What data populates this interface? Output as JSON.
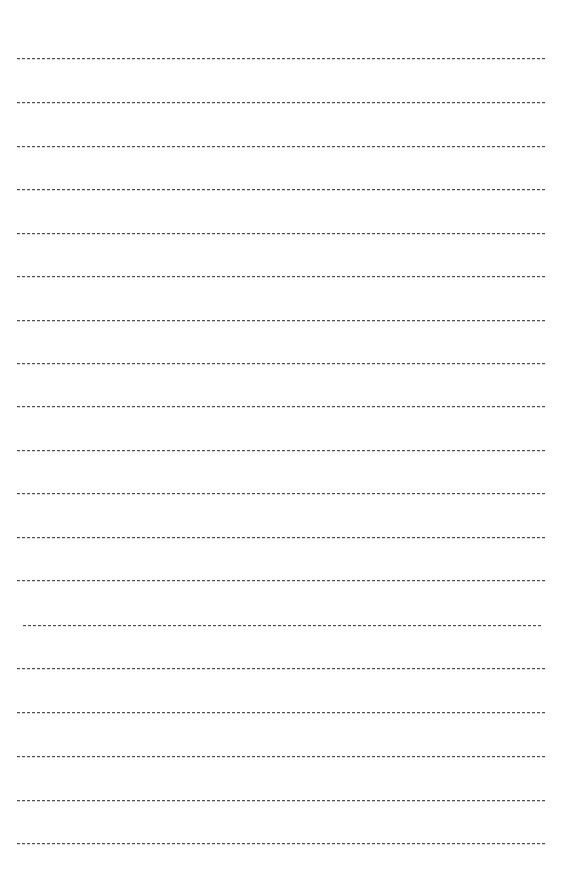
{
  "page": {
    "kind": "ruled-practice-sheet",
    "width": 563,
    "height": 883,
    "background_color": "#ffffff",
    "line_color": "#4f4f4f",
    "line_count": 19,
    "dash_length_px": 3.4,
    "dash_gap_px": 1.6,
    "line_thickness_px": 1,
    "line_spacing_px": 43.6,
    "default_left_margin_px": 17,
    "default_right_margin_px": 18,
    "first_line_y_px": 58,
    "last_line_y_px": 843
  },
  "lines": [
    {
      "index": 1,
      "y": 58,
      "left": 17,
      "right": 545,
      "style": "dashed"
    },
    {
      "index": 2,
      "y": 102,
      "left": 17,
      "right": 545,
      "style": "dashed"
    },
    {
      "index": 3,
      "y": 146,
      "left": 17,
      "right": 545,
      "style": "dashed"
    },
    {
      "index": 4,
      "y": 189,
      "left": 17,
      "right": 546,
      "style": "dashed"
    },
    {
      "index": 5,
      "y": 233,
      "left": 17,
      "right": 545,
      "style": "dashed"
    },
    {
      "index": 6,
      "y": 276,
      "left": 17,
      "right": 545,
      "style": "dashed"
    },
    {
      "index": 7,
      "y": 320,
      "left": 17,
      "right": 545,
      "style": "dashed"
    },
    {
      "index": 8,
      "y": 363,
      "left": 17,
      "right": 546,
      "style": "dashed"
    },
    {
      "index": 9,
      "y": 406,
      "left": 17,
      "right": 545,
      "style": "dashed"
    },
    {
      "index": 10,
      "y": 450,
      "left": 17,
      "right": 545,
      "style": "dashed"
    },
    {
      "index": 11,
      "y": 493,
      "left": 17,
      "right": 546,
      "style": "dashed"
    },
    {
      "index": 12,
      "y": 537,
      "left": 17,
      "right": 545,
      "style": "dashed"
    },
    {
      "index": 13,
      "y": 580,
      "left": 17,
      "right": 546,
      "style": "dashed"
    },
    {
      "index": 14,
      "y": 625,
      "left": 23,
      "right": 541,
      "style": "dashed-indented"
    },
    {
      "index": 15,
      "y": 668,
      "left": 17,
      "right": 545,
      "style": "dashed"
    },
    {
      "index": 16,
      "y": 712,
      "left": 17,
      "right": 545,
      "style": "dashed"
    },
    {
      "index": 17,
      "y": 756,
      "left": 17,
      "right": 546,
      "style": "dashed"
    },
    {
      "index": 18,
      "y": 800,
      "left": 17,
      "right": 545,
      "style": "dashed"
    },
    {
      "index": 19,
      "y": 843,
      "left": 17,
      "right": 545,
      "style": "dashed"
    }
  ]
}
